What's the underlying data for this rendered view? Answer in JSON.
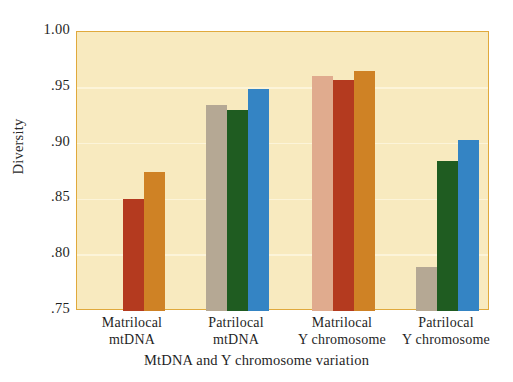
{
  "chart_data": {
    "type": "bar",
    "title": "",
    "xlabel": "MtDNA and Y chromosome variation",
    "ylabel": "Diversity",
    "categories": [
      "Matrilocal mtDNA",
      "Patrilocal mtDNA",
      "Matrilocal Y chromosome",
      "Patrilocal Y chromosome"
    ],
    "category_lines": [
      [
        "Matrilocal",
        "mtDNA"
      ],
      [
        "Patrilocal",
        "mtDNA"
      ],
      [
        "Matrilocal",
        "Y chromosome"
      ],
      [
        "Patrilocal",
        "Y chromosome"
      ]
    ],
    "ylim": [
      0.75,
      1.0
    ],
    "yticks": [
      1.0,
      0.95,
      0.9,
      0.85,
      0.8,
      0.75
    ],
    "ytick_labels": [
      "1.00",
      ".95",
      ".90",
      ".85",
      ".80",
      ".75"
    ],
    "grid": true,
    "legend": "none",
    "bars_per_group": 3,
    "groups": [
      {
        "name": "Matrilocal mtDNA",
        "bars": [
          {
            "value": 0.856,
            "color": "#dca храм"
          },
          {
            "value": 0.85,
            "color": "#b43a1f"
          },
          {
            "value": 0.875,
            "color": "#cf8225"
          }
        ]
      },
      {
        "name": "Patrilocal mtDNA",
        "bars": [
          {
            "value": 0.935,
            "color": "#b5a894"
          },
          {
            "value": 0.93,
            "color": "#1f5c21"
          },
          {
            "value": 0.949,
            "color": "#3484c4"
          }
        ]
      },
      {
        "name": "Matrilocal Y chromosome",
        "bars": [
          {
            "value": 0.961,
            "color": "#e0ab8e"
          },
          {
            "value": 0.957,
            "color": "#b43a1f"
          },
          {
            "value": 0.965,
            "color": "#cf8225"
          }
        ]
      },
      {
        "name": "Patrilocal Y chromosome",
        "bars": [
          {
            "value": 0.789,
            "color": "#b5a894"
          },
          {
            "value": 0.884,
            "color": "#1f5c21"
          },
          {
            "value": 0.903,
            "color": "#3484c4"
          }
        ]
      }
    ],
    "colors": {
      "plot_background": "#f8eabf",
      "frame_border": "#e0a93c",
      "gridline": "#fdf6dd",
      "page_background": "#ffffff",
      "salmon": "#e0ab8e",
      "brick_red": "#b43a1f",
      "orange_brown": "#cf8225",
      "taupe_gray": "#b5a894",
      "dark_green": "#1f5c21",
      "blue": "#3484c4"
    }
  }
}
